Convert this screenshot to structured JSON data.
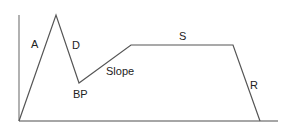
{
  "diagram": {
    "title": "",
    "type": "envelope",
    "colors": {
      "line": "#555555",
      "axis": "#888888",
      "text": "#222222"
    },
    "axes": {
      "y": {
        "x1": 19,
        "y1": 15,
        "x2": 19,
        "y2": 121
      },
      "x": {
        "x1": 19,
        "y1": 121,
        "x2": 278,
        "y2": 121
      }
    },
    "points": [
      {
        "name": "start",
        "x": 19,
        "y": 121
      },
      {
        "name": "peak",
        "x": 56,
        "y": 15
      },
      {
        "name": "breakpoint",
        "x": 79,
        "y": 83
      },
      {
        "name": "sustain-start",
        "x": 131,
        "y": 45
      },
      {
        "name": "sustain-end",
        "x": 233,
        "y": 45
      },
      {
        "name": "end",
        "x": 260,
        "y": 121
      }
    ],
    "labels": {
      "attack": {
        "text": "A",
        "x": 31,
        "y": 48
      },
      "decay": {
        "text": "D",
        "x": 72,
        "y": 49
      },
      "breakpoint": {
        "text": "BP",
        "x": 73,
        "y": 98
      },
      "slope": {
        "text": "Slope",
        "x": 106,
        "y": 75
      },
      "sustain": {
        "text": "S",
        "x": 179,
        "y": 40
      },
      "release": {
        "text": "R",
        "x": 250,
        "y": 89
      }
    }
  }
}
